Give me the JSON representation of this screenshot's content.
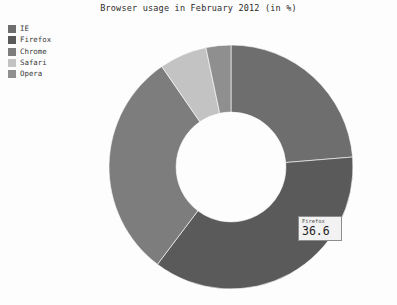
{
  "chart_data": {
    "type": "pie",
    "variant": "donut",
    "title": "Browser usage in February 2012 (in %)",
    "xlabel": "",
    "ylabel": "",
    "legend_position": "top-left",
    "grid": false,
    "start_angle_deg": 0,
    "direction": "clockwise",
    "inner_radius_ratio": 0.45,
    "categories": [
      "IE",
      "Firefox",
      "Chrome",
      "Safari",
      "Opera"
    ],
    "values": [
      23.7,
      36.6,
      30.1,
      6.3,
      3.3
    ],
    "colors": [
      "#6e6e6e",
      "#5a5a5a",
      "#7d7d7d",
      "#c3c3c3",
      "#8f8f8f"
    ],
    "series": [
      {
        "name": "Browser usage",
        "values": [
          23.7,
          36.6,
          30.1,
          6.3,
          3.3
        ]
      }
    ],
    "slices": [
      {
        "label": "IE",
        "value": 23.7,
        "color": "#6e6e6e"
      },
      {
        "label": "Firefox",
        "value": 36.6,
        "color": "#5a5a5a"
      },
      {
        "label": "Chrome",
        "value": 30.1,
        "color": "#7d7d7d"
      },
      {
        "label": "Safari",
        "value": 6.3,
        "color": "#c3c3c3"
      },
      {
        "label": "Opera",
        "value": 3.3,
        "color": "#8f8f8f"
      }
    ],
    "annotations": [
      {
        "name": "tooltip",
        "label": "Firefox",
        "value": "36.6"
      }
    ]
  },
  "legend": {
    "items": [
      {
        "label": "IE",
        "color": "#6e6e6e"
      },
      {
        "label": "Firefox",
        "color": "#5a5a5a"
      },
      {
        "label": "Chrome",
        "color": "#7d7d7d"
      },
      {
        "label": "Safari",
        "color": "#c3c3c3"
      },
      {
        "label": "Opera",
        "color": "#8f8f8f"
      }
    ]
  },
  "tooltip": {
    "label": "Firefox",
    "value": "36.6"
  },
  "colors": {
    "background": "#fdfdfd",
    "title_text": "#2b2b2b",
    "tooltip_border": "#8e8e8e",
    "tooltip_bg": "#f2f2f2"
  }
}
